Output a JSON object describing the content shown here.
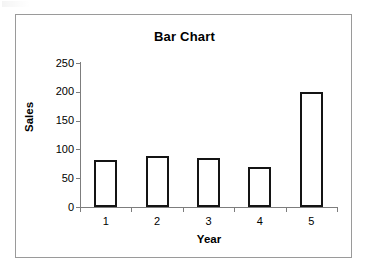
{
  "chart_data": {
    "type": "bar",
    "title": "Bar Chart",
    "xlabel": "Year",
    "ylabel": "Sales",
    "categories": [
      "1",
      "2",
      "3",
      "4",
      "5"
    ],
    "values": [
      82,
      88,
      85,
      70,
      200
    ],
    "ylim": [
      0,
      250
    ],
    "yticks": [
      0,
      50,
      100,
      150,
      200,
      250
    ],
    "ytick_labels": [
      "0",
      "50",
      "100",
      "150",
      "200",
      "250"
    ],
    "grid": false,
    "legend": null,
    "legend_position": "none",
    "series": [
      {
        "name": "Sales",
        "values": [
          82,
          88,
          85,
          70,
          200
        ]
      }
    ],
    "style": {
      "bar_fill": "#ffffff",
      "bar_border": "#141414",
      "axis_color": "#7d7d7d",
      "frame_color": "#9a9a9a",
      "text_color": "#000000",
      "background": "#ffffff"
    }
  }
}
